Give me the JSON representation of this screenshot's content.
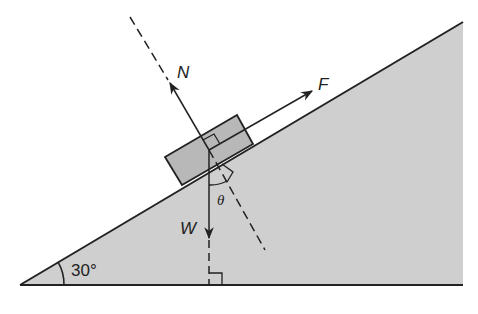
{
  "diagram": {
    "type": "inclined-plane-free-body",
    "colors": {
      "incline_fill": "#cfcfcf",
      "block_fill": "#b8b8b8",
      "stroke": "#222222",
      "background": "#ffffff"
    },
    "incline_angle_label": "30°",
    "forces": {
      "normal": {
        "label": "N"
      },
      "applied": {
        "label": "F"
      },
      "weight": {
        "label": "W"
      }
    },
    "angle_theta_label": "θ"
  }
}
